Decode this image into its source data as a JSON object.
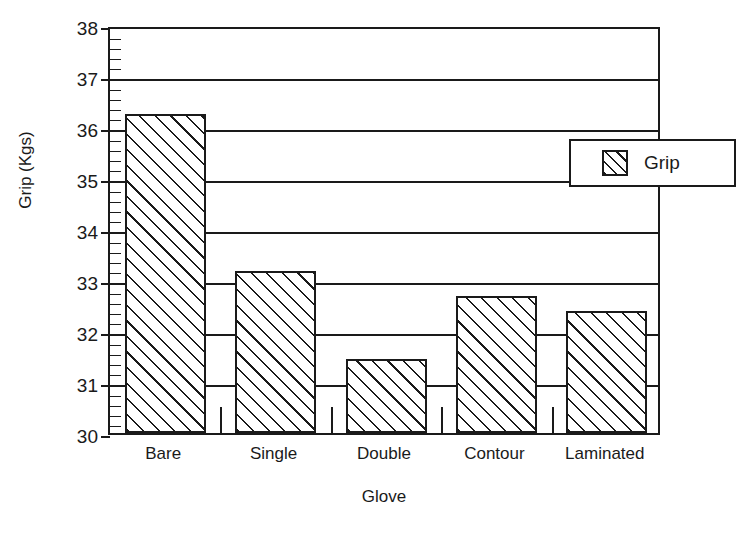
{
  "chart_data": {
    "type": "bar",
    "title": "",
    "subtitle": "",
    "xlabel": "Glove",
    "ylabel": "Grip (Kgs)",
    "categories": [
      "Bare",
      "Single",
      "Double",
      "Contour",
      "Laminated"
    ],
    "series": [
      {
        "name": "Grip",
        "values": [
          36.25,
          33.18,
          31.45,
          32.68,
          32.4
        ]
      }
    ],
    "ylim": [
      30,
      38
    ],
    "ytick_labels": [
      "30",
      "31",
      "32",
      "33",
      "34",
      "35",
      "36",
      "37",
      "38"
    ],
    "ytick_values": [
      30,
      31,
      32,
      33,
      34,
      35,
      36,
      37,
      38
    ],
    "yminor_step": 0.2,
    "xtick_labels": [
      "Bare",
      "Single",
      "Double",
      "Contour",
      "Laminated"
    ],
    "grid": true,
    "grid_axis": "y",
    "legend": {
      "position": "upper-right",
      "entries": [
        {
          "label": "Grip",
          "swatch": "diagonal-hatch"
        }
      ]
    },
    "style": {
      "bar_fill": "#ffffff",
      "bar_hatch": "diagonal-45",
      "bar_edge_color": "#1a1a1a",
      "axis_color": "#1a1a1a",
      "background": "#ffffff"
    }
  }
}
